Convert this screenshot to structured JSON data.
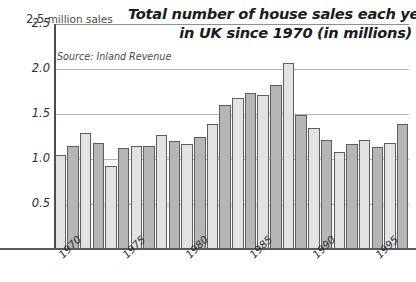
{
  "chart_data": {
    "type": "bar",
    "title": "Total number of house sales each year in UK since 1970 (in millions)",
    "title_line1": "Total number of house sales each year",
    "title_line2": "in UK since 1970 (in millions)",
    "source": "Source: Inland Revenue",
    "yaxis_caption_value": "2.5",
    "yaxis_caption_unit": "million sales",
    "xlabel": "",
    "ylabel": "million sales",
    "ylim": [
      0,
      2.5
    ],
    "grid": true,
    "legend": "none",
    "ytick_labels": [
      "2.5",
      "2.0",
      "1.5",
      "1.0",
      "0.5"
    ],
    "ytick_values": [
      2.5,
      2.0,
      1.5,
      1.0,
      0.5
    ],
    "xtick_labels": [
      "1970",
      "1975",
      "1980",
      "1985",
      "1990",
      "1995"
    ],
    "xtick_years": [
      1970,
      1975,
      1980,
      1985,
      1990,
      1995
    ],
    "categories": [
      "1970",
      "1971",
      "1972",
      "1973",
      "1974",
      "1975",
      "1976",
      "1977",
      "1978",
      "1979",
      "1980",
      "1981",
      "1982",
      "1983",
      "1984",
      "1985",
      "1986",
      "1987",
      "1988",
      "1989",
      "1990",
      "1991",
      "1992",
      "1993",
      "1994",
      "1995",
      "1996",
      "1997"
    ],
    "values": [
      1.05,
      1.14,
      1.29,
      1.18,
      0.92,
      1.12,
      1.14,
      1.15,
      1.27,
      1.2,
      1.17,
      1.25,
      1.39,
      1.6,
      1.68,
      1.73,
      1.71,
      1.82,
      2.07,
      1.49,
      1.35,
      1.21,
      1.08,
      1.17,
      1.21,
      1.13,
      1.18,
      1.39
    ],
    "bar_shades": [
      "light",
      "dark",
      "light",
      "dark",
      "light",
      "dark",
      "light",
      "dark",
      "light",
      "dark",
      "light",
      "dark",
      "light",
      "dark",
      "light",
      "dark",
      "light",
      "dark",
      "light",
      "dark",
      "light",
      "dark",
      "light",
      "dark",
      "light",
      "dark",
      "light",
      "dark"
    ],
    "colors": {
      "bar_light": "#e2e2e2",
      "bar_dark": "#b6b6b6",
      "bar_outline": "#5e5e5e",
      "gridline": "#b4b4b4",
      "axis": "#4d4d4d",
      "text": "#1b1b1b",
      "muted_text": "#4a4a4a",
      "background": "#ffffff"
    }
  }
}
